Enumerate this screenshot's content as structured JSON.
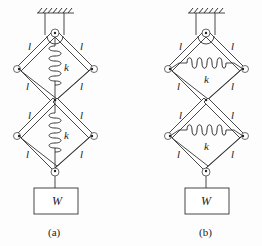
{
  "figures": [
    {
      "id": "a",
      "caption": "(a)",
      "spring_orientation": "vertical",
      "link_label": "l",
      "spring_label": "k",
      "weight_label": "W"
    },
    {
      "id": "b",
      "caption": "(b)",
      "spring_orientation": "horizontal",
      "link_label": "l",
      "spring_label": "k",
      "weight_label": "W"
    }
  ],
  "colors": {
    "line": "#333333",
    "background": "#ffffff"
  }
}
